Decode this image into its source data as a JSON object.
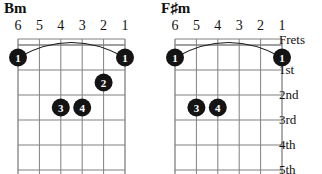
{
  "page": {
    "background_color": "#ffffff",
    "ink_color": "#1a1a1a",
    "grid_color": "#808080",
    "dot_fill": "#141414",
    "dot_text_color": "#ffffff"
  },
  "diagrams": [
    {
      "id": "bm",
      "title": "Bm",
      "title_root": "B",
      "title_accidental": "",
      "title_quality": "m",
      "string_numbers": [
        "6",
        "5",
        "4",
        "3",
        "2",
        "1"
      ],
      "strings": 6,
      "frets": 5,
      "barre": {
        "finger": "1",
        "fret": 1,
        "from_string": 6,
        "to_string": 1,
        "label": "barre-1st-fret"
      },
      "dots": [
        {
          "finger": "1",
          "string": 6,
          "fret": 1
        },
        {
          "finger": "1",
          "string": 1,
          "fret": 1
        },
        {
          "finger": "2",
          "string": 2,
          "fret": 2
        },
        {
          "finger": "3",
          "string": 4,
          "fret": 3
        },
        {
          "finger": "4",
          "string": 3,
          "fret": 3
        }
      ],
      "fret_labels_visible": false,
      "fret_labels": []
    },
    {
      "id": "fsm",
      "title": "F♯m",
      "title_root": "F",
      "title_accidental": "♯",
      "title_quality": "m",
      "string_numbers": [
        "6",
        "5",
        "4",
        "3",
        "2",
        "1"
      ],
      "strings": 6,
      "frets": 5,
      "barre": {
        "finger": "1",
        "fret": 1,
        "from_string": 6,
        "to_string": 1,
        "label": "barre-1st-fret"
      },
      "dots": [
        {
          "finger": "1",
          "string": 6,
          "fret": 1
        },
        {
          "finger": "1",
          "string": 1,
          "fret": 1
        },
        {
          "finger": "3",
          "string": 5,
          "fret": 3
        },
        {
          "finger": "4",
          "string": 4,
          "fret": 3
        }
      ],
      "fret_labels_visible": true,
      "fret_labels": [
        "Frets",
        "1st",
        "2nd",
        "3rd",
        "4th",
        "5th"
      ]
    }
  ]
}
